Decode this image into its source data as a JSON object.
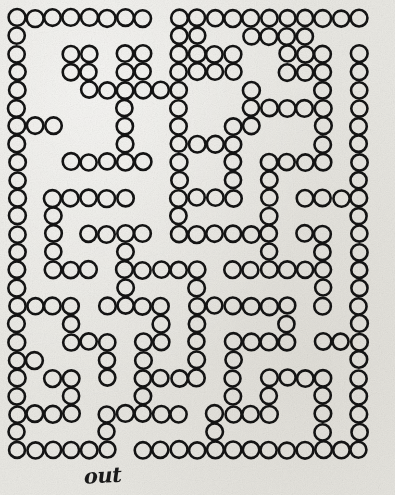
{
  "document": {
    "kind": "printed-maze-puzzle",
    "title": "Circle Maze",
    "page_width": 395,
    "page_height": 495,
    "background_color": "#e9e8e3",
    "ink_color": "#141414"
  },
  "annotations": {
    "out_label": "out",
    "out_label_style": "handwritten-cursive",
    "out_label_x": 84,
    "out_label_y": 462
  },
  "maze": {
    "columns": 21,
    "rows": 25,
    "origin_x": 17,
    "origin_y": 18,
    "pitch": 18,
    "dot_radius": 8.2,
    "dot_shape": "circle-outline",
    "entrance": {
      "label": "entrance",
      "row": 0,
      "col": 8
    },
    "exit": {
      "label": "out",
      "row": 24,
      "col": 6
    },
    "grid": [
      "11111111011111111111",
      "10000000011001111000",
      "10011011011110011101",
      "10011011011110011101",
      "10001111110001000101",
      "10000010010001111101",
      "11100010010011000101",
      "10000010011110000101",
      "10011111010010111101",
      "10000000010010100001",
      "10111110011110101111",
      "10100000010000100001",
      "10101111011111101101",
      "10100010000000100101",
      "10111011111011111101",
      "10000010001000000101",
      "11110111101111110101",
      "10010000101000010001",
      "10011101101011110111",
      "11000101001010000001",
      "10110101111010111101",
      "10010001000010100101",
      "11110111110111100101",
      "10000100000100000101",
      "11111101111111111111"
    ],
    "grid_legend": {
      "1": "circle present (wall)",
      "0": "empty (path)"
    }
  }
}
